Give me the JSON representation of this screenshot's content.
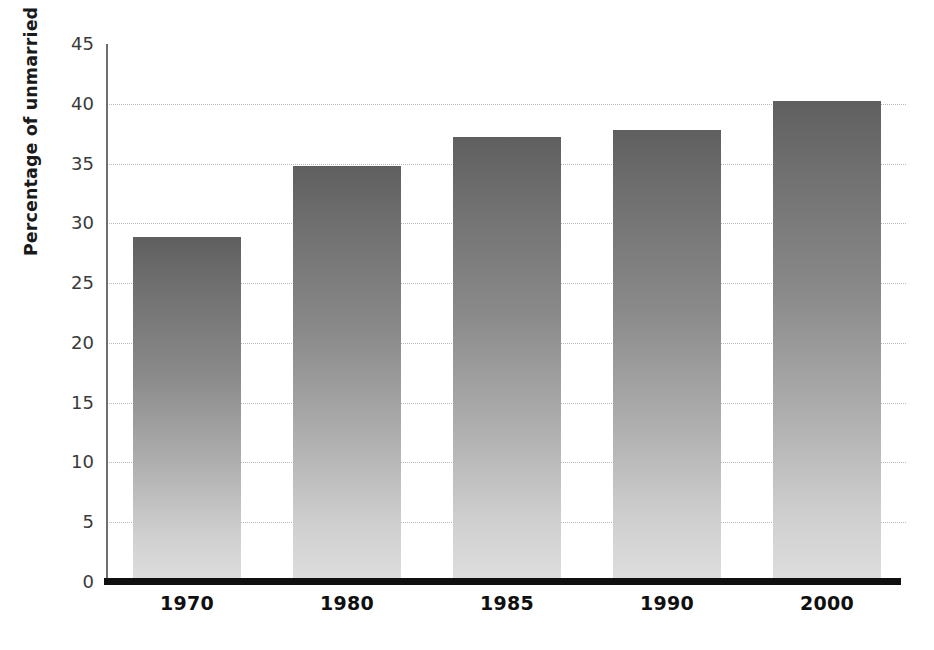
{
  "chart_data": {
    "type": "bar",
    "title": "",
    "xlabel": "",
    "ylabel": "Percentage of unmarried people over 18",
    "categories": [
      "1970",
      "1980",
      "1985",
      "1990",
      "2000"
    ],
    "values": [
      28.9,
      34.8,
      37.2,
      37.8,
      40.2
    ],
    "ylim": [
      0,
      45
    ],
    "ytick_values": [
      0,
      5,
      10,
      15,
      20,
      25,
      30,
      35,
      40,
      45
    ],
    "ytick_labels": [
      "0",
      "5",
      "10",
      "15",
      "20",
      "25",
      "30",
      "35",
      "40",
      "45"
    ],
    "grid": true,
    "grid_style": "dotted",
    "grid_color": "#b9b9b9",
    "legend": null,
    "legend_position": "none",
    "bar_fill_top_color": "#5f5f5f",
    "bar_fill_bottom_color": "#dedede",
    "axis_line_color": "#101010",
    "text_color": "#0f0f0f"
  }
}
